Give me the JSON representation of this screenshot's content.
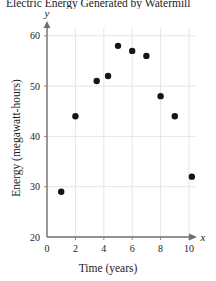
{
  "chart_data": {
    "type": "scatter",
    "title": "Electric Energy Generated by Watermill",
    "xlabel": "Time (years)",
    "ylabel": "Energy (megawatt-hours)",
    "x_axis_variable": "x",
    "y_axis_variable": "y",
    "xlim": [
      0,
      11
    ],
    "ylim": [
      20,
      63
    ],
    "xticks": [
      0,
      2,
      4,
      6,
      8,
      10
    ],
    "xtick_labels": [
      "0",
      "2",
      "4",
      "6",
      "8",
      "10"
    ],
    "yticks": [
      20,
      30,
      40,
      50,
      60
    ],
    "ytick_labels": [
      "20",
      "30",
      "40",
      "50",
      "60"
    ],
    "grid": true,
    "legend": false,
    "point_color": "#151515",
    "grid_color": "#dedede",
    "axis_color": "#6e6e6e",
    "x": [
      1,
      2,
      3.5,
      4.3,
      5,
      6,
      7,
      8,
      9,
      10.2
    ],
    "y": [
      29,
      44,
      51,
      52,
      58,
      57,
      56,
      48,
      44,
      32
    ],
    "points": [
      {
        "x": 1,
        "y": 29
      },
      {
        "x": 2,
        "y": 44
      },
      {
        "x": 3.5,
        "y": 51
      },
      {
        "x": 4.3,
        "y": 52
      },
      {
        "x": 5,
        "y": 58
      },
      {
        "x": 6,
        "y": 57
      },
      {
        "x": 7,
        "y": 56
      },
      {
        "x": 8,
        "y": 48
      },
      {
        "x": 9,
        "y": 44
      },
      {
        "x": 10.2,
        "y": 32
      }
    ]
  }
}
